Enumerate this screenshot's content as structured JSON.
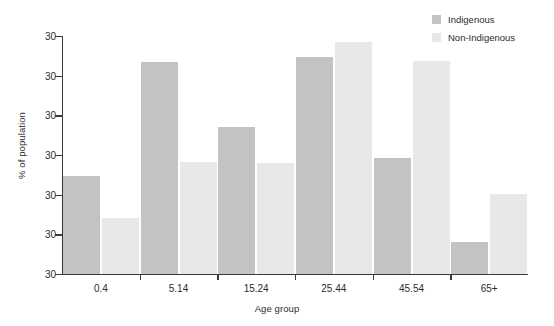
{
  "chart_data": {
    "type": "bar",
    "title": "",
    "xlabel": "Age group",
    "ylabel": "% of population",
    "categories": [
      "0.4",
      "5.14",
      "15.24",
      "25.44",
      "45.54",
      "65+"
    ],
    "series": [
      {
        "name": "Indigenous",
        "color": "#c3c3c3",
        "values": [
          41.2,
          89.1,
          61.8,
          91.2,
          48.7,
          13.4
        ]
      },
      {
        "name": "Non-Indigenous",
        "color": "#e8e8e8",
        "values": [
          23.5,
          47.1,
          46.6,
          97.5,
          89.5,
          33.6
        ]
      }
    ],
    "ytick_labels": [
      "30",
      "30",
      "30",
      "30",
      "30",
      "30",
      "30"
    ],
    "ylim": [
      0,
      100
    ],
    "grid": false,
    "legend_position": "top-right",
    "legend_entries": [
      "Indigenous",
      "Non-Indigenous"
    ]
  },
  "axis": {
    "y_title": "% of population",
    "x_title": "Age group"
  },
  "colors": {
    "indigenous": "#c3c3c3",
    "non_indigenous": "#e8e8e8",
    "axis": "#3a3a3a",
    "text": "#2b2b2b",
    "background": "#ffffff"
  }
}
